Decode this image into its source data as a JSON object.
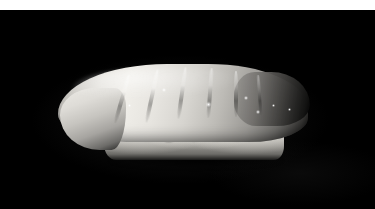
{
  "image": {
    "subject": "Nigiri sushi",
    "description": "A single piece of nigiri sushi photographed in grayscale: a pale slice of white fish draped over a mound of rice grains, isolated on a black background.",
    "orientation": "landscape",
    "width_px": 375,
    "height_px": 209,
    "color_mode": "grayscale",
    "background_color": "#000000",
    "border": {
      "top_band_color": "#ffffff",
      "top_band_height_px": 10
    },
    "lighting": "top-left soft key light",
    "palette": {
      "background": "#000000",
      "fish_highlight": "#f0eee9",
      "fish_midtone": "#bdbbb6",
      "fish_shadow": "#3b3a38",
      "rice_highlight": "#f4f2ec",
      "rice_midtone": "#cfcdc7",
      "rice_shadow": "#6e6d69",
      "frame_band": "#ffffff"
    },
    "subject_bounds": {
      "left_px": 58,
      "top_px": 58,
      "right_px": 308,
      "bottom_px": 158
    },
    "parts": [
      {
        "name": "neta",
        "label": "Fish topping"
      },
      {
        "name": "shari",
        "label": "Rice bed"
      },
      {
        "name": "draped-tip",
        "label": "Draped left tip of fish"
      },
      {
        "name": "tail-end",
        "label": "Shaded right tail end"
      }
    ],
    "rice_grains": [
      {
        "x": 48,
        "y": 58,
        "w": 17,
        "h": 13,
        "r": -12
      },
      {
        "x": 60,
        "y": 68,
        "w": 15,
        "h": 12,
        "r": 8
      },
      {
        "x": 72,
        "y": 56,
        "w": 18,
        "h": 14,
        "r": 16
      },
      {
        "x": 82,
        "y": 70,
        "w": 16,
        "h": 12,
        "r": -6
      },
      {
        "x": 94,
        "y": 58,
        "w": 19,
        "h": 14,
        "r": 10
      },
      {
        "x": 104,
        "y": 71,
        "w": 15,
        "h": 12,
        "r": -18
      },
      {
        "x": 116,
        "y": 57,
        "w": 18,
        "h": 13,
        "r": 4
      },
      {
        "x": 127,
        "y": 70,
        "w": 16,
        "h": 12,
        "r": 14
      },
      {
        "x": 139,
        "y": 59,
        "w": 17,
        "h": 13,
        "r": -10
      },
      {
        "x": 150,
        "y": 71,
        "w": 15,
        "h": 11,
        "r": 6
      },
      {
        "x": 161,
        "y": 60,
        "w": 18,
        "h": 13,
        "r": 12
      },
      {
        "x": 172,
        "y": 70,
        "w": 15,
        "h": 12,
        "r": -8
      },
      {
        "x": 183,
        "y": 61,
        "w": 17,
        "h": 12,
        "r": 9
      },
      {
        "x": 194,
        "y": 70,
        "w": 14,
        "h": 11,
        "r": -14
      },
      {
        "x": 204,
        "y": 62,
        "w": 15,
        "h": 11,
        "r": 5
      },
      {
        "x": 213,
        "y": 69,
        "w": 13,
        "h": 10,
        "r": 11
      }
    ],
    "score_lines": [
      {
        "x": 62,
        "y": 16,
        "w": 4,
        "h": 50,
        "r": 16
      },
      {
        "x": 92,
        "y": 11,
        "w": 4,
        "h": 54,
        "r": 12
      },
      {
        "x": 122,
        "y": 9,
        "w": 4,
        "h": 52,
        "r": 8
      },
      {
        "x": 150,
        "y": 10,
        "w": 4,
        "h": 50,
        "r": 4
      },
      {
        "x": 176,
        "y": 13,
        "w": 4,
        "h": 46,
        "r": 0
      },
      {
        "x": 200,
        "y": 17,
        "w": 3,
        "h": 40,
        "r": -4
      }
    ],
    "speculars": [
      {
        "x": 148,
        "y": 44,
        "s": 5
      },
      {
        "x": 186,
        "y": 38,
        "s": 4
      },
      {
        "x": 198,
        "y": 52,
        "s": 4
      },
      {
        "x": 214,
        "y": 46,
        "s": 3
      },
      {
        "x": 104,
        "y": 30,
        "s": 4
      },
      {
        "x": 70,
        "y": 46,
        "s": 3
      },
      {
        "x": 230,
        "y": 50,
        "s": 3
      }
    ]
  }
}
